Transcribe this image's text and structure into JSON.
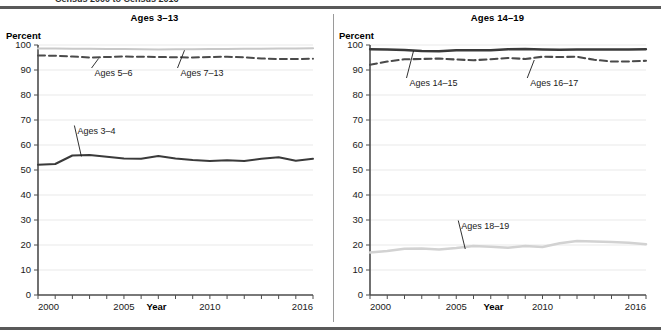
{
  "header": {
    "cut_off_text": "Census 2000 to Census 2016",
    "rule_color": "#595959"
  },
  "panels": [
    {
      "id": "left",
      "title": "Ages 3–13",
      "ylabel": "Percent",
      "xlabel": "Year"
    },
    {
      "id": "right",
      "title": "Ages 14–19",
      "ylabel": "Percent",
      "xlabel": "Year"
    }
  ],
  "axis": {
    "yticks": [
      0,
      10,
      20,
      30,
      40,
      50,
      60,
      70,
      80,
      90,
      100
    ],
    "ytick_labels": [
      "0",
      "10",
      "20",
      "30",
      "40",
      "50",
      "60",
      "70",
      "80",
      "90",
      "100"
    ],
    "xticks": [
      2000,
      2001,
      2002,
      2003,
      2004,
      2005,
      2006,
      2007,
      2008,
      2009,
      2010,
      2011,
      2012,
      2013,
      2014,
      2015,
      2016
    ],
    "xtick_labels_shown": [
      "2000",
      "2005",
      "2010",
      "2016"
    ],
    "ylim": [
      0,
      100
    ],
    "xlim": [
      2000,
      2016
    ],
    "grid": true
  },
  "chart_data": [
    {
      "type": "line",
      "title": "Ages 3–13",
      "xlabel": "Year",
      "ylabel": "Percent",
      "ylim": [
        0,
        100
      ],
      "xlim": [
        2000,
        2016
      ],
      "grid": true,
      "legend_position": "inline-annotations",
      "x": [
        2000,
        2001,
        2002,
        2003,
        2004,
        2005,
        2006,
        2007,
        2008,
        2009,
        2010,
        2011,
        2012,
        2013,
        2014,
        2015,
        2016
      ],
      "series": [
        {
          "name": "Ages 7–13",
          "label": "Ages 7–13",
          "style": "solid",
          "color": "#c9c9c9",
          "width": 2.2,
          "values": [
            98.6,
            98.6,
            98.5,
            98.5,
            98.4,
            98.4,
            98.3,
            98.2,
            98.3,
            98.3,
            98.4,
            98.4,
            98.5,
            98.5,
            98.6,
            98.6,
            98.7
          ]
        },
        {
          "name": "Ages 5–6",
          "label": "Ages 5–6",
          "style": "dashed",
          "color": "#4a4a4a",
          "width": 2.0,
          "values": [
            95.8,
            95.7,
            95.4,
            95.0,
            95.2,
            95.4,
            95.3,
            95.2,
            95.1,
            95.0,
            95.2,
            95.3,
            95.1,
            94.6,
            94.4,
            94.4,
            94.5
          ]
        },
        {
          "name": "Ages 3–4",
          "label": "Ages 3–4",
          "style": "solid",
          "color": "#3a3a3a",
          "width": 2.0,
          "values": [
            52.1,
            52.4,
            55.8,
            56.0,
            55.3,
            54.6,
            54.5,
            55.6,
            54.6,
            54.0,
            53.6,
            53.9,
            53.6,
            54.5,
            55.1,
            53.7,
            54.5
          ]
        }
      ],
      "annotations": [
        {
          "text": "Ages 5–6",
          "x": 2003,
          "y": 88
        },
        {
          "text": "Ages 7–13",
          "x": 2008,
          "y": 88
        },
        {
          "text": "Ages 3–4",
          "x": 2002,
          "y": 65
        }
      ]
    },
    {
      "type": "line",
      "title": "Ages 14–19",
      "xlabel": "Year",
      "ylabel": "Percent",
      "ylim": [
        0,
        100
      ],
      "xlim": [
        2000,
        2016
      ],
      "grid": true,
      "legend_position": "inline-annotations",
      "x": [
        2000,
        2001,
        2002,
        2003,
        2004,
        2005,
        2006,
        2007,
        2008,
        2009,
        2010,
        2011,
        2012,
        2013,
        2014,
        2015,
        2016
      ],
      "series": [
        {
          "name": "Ages 14–15",
          "label": "Ages 14–15",
          "style": "solid",
          "color": "#3a3a3a",
          "width": 2.3,
          "values": [
            98.3,
            98.2,
            98.0,
            97.6,
            97.5,
            97.9,
            97.9,
            97.9,
            98.3,
            98.4,
            98.2,
            98.1,
            98.2,
            98.2,
            98.2,
            98.2,
            98.3
          ]
        },
        {
          "name": "Ages 16–17",
          "label": "Ages 16–17",
          "style": "dashed",
          "color": "#4a4a4a",
          "width": 2.1,
          "values": [
            92.1,
            93.4,
            94.3,
            94.4,
            94.6,
            94.2,
            93.9,
            94.3,
            94.8,
            94.4,
            95.3,
            95.2,
            95.3,
            94.1,
            93.4,
            93.4,
            93.7
          ]
        },
        {
          "name": "Ages 18–19",
          "label": "Ages 18–19",
          "style": "solid",
          "color": "#d2d2d2",
          "width": 2.6,
          "values": [
            17.0,
            17.6,
            18.5,
            18.6,
            18.2,
            18.8,
            19.6,
            19.3,
            18.9,
            19.6,
            19.2,
            20.7,
            21.6,
            21.4,
            21.2,
            20.9,
            20.3
          ]
        }
      ],
      "annotations": [
        {
          "text": "Ages 14–15",
          "x": 2002,
          "y": 84
        },
        {
          "text": "Ages 16–17",
          "x": 2009,
          "y": 84
        },
        {
          "text": "Ages 18–19",
          "x": 2005,
          "y": 27
        }
      ]
    }
  ]
}
